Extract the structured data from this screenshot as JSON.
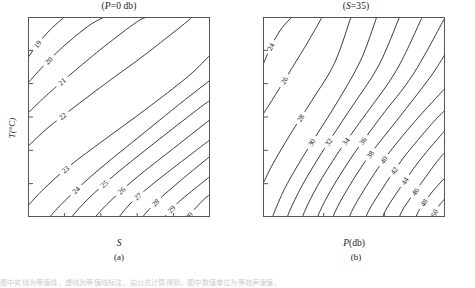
{
  "figure": {
    "caption_strip": "图中实线为等值线，虚线为等值线标注，由公式计算得到，图中数值单位为等效声速值。"
  },
  "panels": [
    {
      "id": "a",
      "title_prefix": "(",
      "title_var": "P",
      "title_rest": "=0 db)",
      "subcaption": "(a)",
      "xlabel_var": "S",
      "xlabel_rest": "",
      "ylabel": "T(°C)",
      "xticks": [
        "30",
        "32",
        "34",
        "36",
        "38",
        "40"
      ],
      "yticks": [
        "0",
        "5",
        "10",
        "15",
        "20",
        "25",
        "30"
      ],
      "contour_labels": [
        "19",
        "20",
        "21",
        "22",
        "23",
        "24",
        "25",
        "26",
        "27",
        "28",
        "29",
        "30",
        "31",
        "32"
      ]
    },
    {
      "id": "b",
      "title_prefix": "(",
      "title_var": "S",
      "title_rest": "=35)",
      "subcaption": "(b)",
      "xlabel_var": "P",
      "xlabel_rest": "(db)",
      "ylabel": "",
      "xticks": [
        "0",
        "2 000",
        "4 000",
        "6 000"
      ],
      "yticks": [
        "0",
        "5",
        "10",
        "15",
        "20",
        "25",
        "30"
      ],
      "contour_labels": [
        "24",
        "26",
        "28",
        "30",
        "32",
        "34",
        "36",
        "38",
        "40",
        "42",
        "44",
        "46",
        "48",
        "50",
        "52",
        "54"
      ]
    }
  ],
  "chart_data": [
    {
      "type": "line",
      "chart_kind": "contour",
      "title": "(P=0 db)",
      "subcaption": "(a)",
      "xlabel": "S",
      "ylabel": "T(°C)",
      "xlim": [
        30,
        40
      ],
      "ylim": [
        0,
        30
      ],
      "xticks": [
        30,
        32,
        34,
        36,
        38,
        40
      ],
      "yticks": [
        0,
        5,
        10,
        15,
        20,
        25,
        30
      ],
      "grid": false,
      "legend": "none",
      "contour_levels": [
        19,
        20,
        21,
        22,
        23,
        24,
        25,
        26,
        27,
        28,
        29,
        30,
        31,
        32
      ],
      "level_step": 1,
      "series": [
        {
          "name": "19",
          "x": [
            30.0,
            30.6,
            31.3,
            32.0
          ],
          "y": [
            23.9,
            26.2,
            28.3,
            30.0
          ]
        },
        {
          "name": "20",
          "x": [
            30.0,
            31.0,
            32.2,
            33.4,
            34.2
          ],
          "y": [
            20.1,
            23.1,
            26.2,
            28.8,
            30.0
          ]
        },
        {
          "name": "21",
          "x": [
            30.0,
            31.2,
            32.6,
            34.2,
            36.0,
            36.6
          ],
          "y": [
            15.6,
            18.7,
            22.0,
            25.6,
            29.3,
            30.0
          ]
        },
        {
          "name": "22",
          "x": [
            30.0,
            31.1,
            32.6,
            34.4,
            36.4,
            38.6,
            39.0
          ],
          "y": [
            10.6,
            13.4,
            16.6,
            20.3,
            24.3,
            29.0,
            30.0
          ]
        },
        {
          "name": "23",
          "x": [
            30.0,
            30.9,
            32.3,
            34.2,
            36.4,
            38.8,
            40.0
          ],
          "y": [
            1.7,
            4.3,
            7.7,
            11.6,
            16.0,
            21.1,
            24.3
          ]
        },
        {
          "name": "24",
          "x": [
            30.9,
            31.2,
            32.2,
            33.8,
            36.0,
            38.4,
            40.0
          ],
          "y": [
            -1.5,
            0.0,
            2.9,
            6.9,
            11.8,
            17.1,
            20.5
          ]
        },
        {
          "name": "25",
          "x": [
            32.1,
            32.4,
            33.3,
            34.8,
            36.9,
            39.3,
            40.0
          ],
          "y": [
            -1.5,
            0.0,
            2.7,
            6.4,
            11.0,
            16.1,
            17.5
          ]
        },
        {
          "name": "26",
          "x": [
            33.4,
            33.7,
            34.6,
            36.0,
            38.0,
            40.0
          ],
          "y": [
            -1.5,
            0.0,
            2.6,
            6.0,
            10.3,
            14.6
          ]
        },
        {
          "name": "27",
          "x": [
            34.7,
            35.0,
            35.8,
            37.2,
            39.1,
            40.0
          ],
          "y": [
            -1.5,
            0.0,
            2.5,
            5.7,
            9.7,
            11.6
          ]
        },
        {
          "name": "28",
          "x": [
            36.0,
            36.3,
            37.1,
            38.4,
            40.0
          ],
          "y": [
            -1.5,
            0.0,
            2.4,
            5.5,
            9.1
          ]
        },
        {
          "name": "29",
          "x": [
            37.2,
            37.5,
            38.3,
            39.6,
            40.0
          ],
          "y": [
            -1.5,
            0.0,
            2.3,
            5.2,
            6.1
          ]
        },
        {
          "name": "30",
          "x": [
            38.5,
            38.8,
            39.5,
            40.0
          ],
          "y": [
            -1.5,
            0.0,
            2.2,
            3.4
          ]
        },
        {
          "name": "31",
          "x": [
            39.7,
            40.0,
            40.0
          ],
          "y": [
            -1.5,
            -0.7,
            0.6
          ]
        },
        {
          "name": "32",
          "x": [
            40.0,
            40.0
          ],
          "y": [
            -1.5,
            -1.0
          ]
        }
      ]
    },
    {
      "type": "line",
      "chart_kind": "contour",
      "title": "(S=35)",
      "subcaption": "(b)",
      "xlabel": "P(db)",
      "ylabel": "T(°C)",
      "xlim": [
        0,
        6000
      ],
      "ylim": [
        0,
        30
      ],
      "xticks": [
        0,
        2000,
        4000,
        6000
      ],
      "yticks": [
        0,
        5,
        10,
        15,
        20,
        25,
        30
      ],
      "grid": false,
      "legend": "none",
      "contour_levels": [
        24,
        26,
        28,
        30,
        32,
        34,
        36,
        38,
        40,
        42,
        44,
        46,
        48,
        50,
        52,
        54
      ],
      "level_step": 2,
      "series": [
        {
          "name": "24",
          "x": [
            0,
            250,
            600,
            950
          ],
          "y": [
            22.8,
            25.5,
            28.2,
            30.0
          ]
        },
        {
          "name": "26",
          "x": [
            0,
            420,
            950,
            1500,
            1950
          ],
          "y": [
            15.4,
            18.4,
            22.3,
            26.4,
            30.0
          ]
        },
        {
          "name": "28",
          "x": [
            0,
            330,
            900,
            1600,
            2350,
            2900
          ],
          "y": [
            5.0,
            8.0,
            12.4,
            17.4,
            23.0,
            30.0
          ]
        },
        {
          "name": "30",
          "x": [
            220,
            380,
            800,
            1500,
            2350,
            3200,
            3750
          ],
          "y": [
            -1.5,
            0.8,
            5.0,
            10.4,
            16.5,
            23.3,
            30.0
          ]
        },
        {
          "name": "32",
          "x": [
            700,
            870,
            1300,
            2000,
            2850,
            3800,
            4500
          ],
          "y": [
            -1.5,
            0.8,
            4.8,
            10.1,
            16.0,
            22.6,
            30.0
          ]
        },
        {
          "name": "34",
          "x": [
            1200,
            1370,
            1800,
            2500,
            3400,
            4400,
            5250
          ],
          "y": [
            -1.5,
            0.8,
            4.7,
            9.8,
            15.5,
            22.0,
            30.0
          ]
        },
        {
          "name": "36",
          "x": [
            1700,
            1870,
            2300,
            3000,
            3900,
            4950,
            6000
          ],
          "y": [
            -1.5,
            0.8,
            4.5,
            9.5,
            15.1,
            21.4,
            29.9
          ]
        },
        {
          "name": "38",
          "x": [
            2200,
            2380,
            2800,
            3500,
            4450,
            5500,
            6000
          ],
          "y": [
            -1.5,
            0.8,
            4.3,
            9.2,
            14.7,
            20.9,
            24.4
          ]
        },
        {
          "name": "40",
          "x": [
            2750,
            2920,
            3350,
            4050,
            5000,
            6000
          ],
          "y": [
            -1.5,
            0.8,
            4.2,
            9.0,
            14.3,
            19.3
          ]
        },
        {
          "name": "42",
          "x": [
            3300,
            3470,
            3900,
            4600,
            5550,
            6000
          ],
          "y": [
            -1.5,
            0.8,
            4.0,
            8.7,
            13.9,
            16.0
          ]
        },
        {
          "name": "44",
          "x": [
            3850,
            4020,
            4450,
            5150,
            6000
          ],
          "y": [
            -1.5,
            0.8,
            3.9,
            8.4,
            13.0
          ]
        },
        {
          "name": "46",
          "x": [
            4400,
            4570,
            5000,
            5700,
            6000
          ],
          "y": [
            -1.5,
            0.8,
            3.7,
            8.1,
            9.7
          ]
        },
        {
          "name": "48",
          "x": [
            4950,
            5120,
            5550,
            6000
          ],
          "y": [
            -1.5,
            0.8,
            3.6,
            5.9
          ]
        },
        {
          "name": "50",
          "x": [
            5500,
            5670,
            6000
          ],
          "y": [
            -1.5,
            0.8,
            2.8
          ]
        },
        {
          "name": "52",
          "x": [
            6000,
            6000
          ],
          "y": [
            -1.5,
            0.6
          ]
        },
        {
          "name": "54",
          "x": [
            6000
          ],
          "y": [
            -1.2
          ]
        }
      ]
    }
  ]
}
